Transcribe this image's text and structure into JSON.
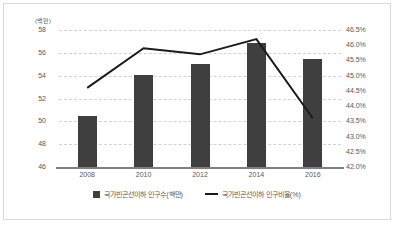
{
  "chart_data": {
    "type": "bar",
    "title": "",
    "xlabel": "",
    "ylabel": "(백만)",
    "categories": [
      "2008",
      "2010",
      "2012",
      "2014",
      "2016"
    ],
    "series": [
      {
        "name": "국가빈곤선이하 인구수(백만)",
        "type": "bar",
        "axis": "left",
        "color": "#3f3f3f",
        "values": [
          50.5,
          54.1,
          55.0,
          56.9,
          55.5
        ]
      },
      {
        "name": "국가빈곤선이하 인구비율(%)",
        "type": "line",
        "axis": "right",
        "color": "#1a1a1a",
        "values": [
          44.6,
          45.9,
          45.7,
          46.2,
          43.6
        ]
      }
    ],
    "ylim": [
      46,
      58
    ],
    "ylim_right": [
      42.0,
      46.5
    ],
    "y_ticks_left": [
      "58",
      "56",
      "54",
      "52",
      "50",
      "48",
      "46"
    ],
    "y_ticks_right": [
      "46.5%",
      "46.0%",
      "45.5%",
      "45.0%",
      "44.5%",
      "44.0%",
      "43.5%",
      "43.0%",
      "42.5%",
      "42.0%"
    ],
    "grid": true,
    "legend_position": "bottom"
  },
  "axes": {
    "unit_label": "(백만)",
    "left_ticks": [
      {
        "label": "58",
        "value": 58
      },
      {
        "label": "56",
        "value": 56
      },
      {
        "label": "54",
        "value": 54
      },
      {
        "label": "52",
        "value": 52
      },
      {
        "label": "50",
        "value": 50
      },
      {
        "label": "48",
        "value": 48
      },
      {
        "label": "46",
        "value": 46
      }
    ],
    "right_ticks": [
      {
        "label": "46.5%",
        "value": 46.5
      },
      {
        "label": "46.0%",
        "value": 46.0
      },
      {
        "label": "45.5%",
        "value": 45.5
      },
      {
        "label": "45.0%",
        "value": 45.0
      },
      {
        "label": "44.5%",
        "value": 44.5
      },
      {
        "label": "44.0%",
        "value": 44.0
      },
      {
        "label": "43.5%",
        "value": 43.5
      },
      {
        "label": "43.0%",
        "value": 43.0
      },
      {
        "label": "42.5%",
        "value": 42.5
      },
      {
        "label": "42.0%",
        "value": 42.0
      }
    ],
    "x_labels": [
      "2008",
      "2010",
      "2012",
      "2014",
      "2016"
    ]
  },
  "legend": {
    "items": [
      {
        "label": "국가빈곤선이하 인구수(백만)",
        "marker": "square",
        "color": "#3f3f3f"
      },
      {
        "label": "국가빈곤선이하 인구비율(%)",
        "marker": "line",
        "color": "#1a1a1a"
      }
    ]
  },
  "style": {
    "bar_color": "#3f3f3f",
    "line_color": "#1a1a1a",
    "grid_color": "#d2d2d2",
    "axis_color": "#7f7f7f",
    "border_color": "#d9d9d9",
    "text_color": "#595959",
    "background": "#ffffff"
  }
}
